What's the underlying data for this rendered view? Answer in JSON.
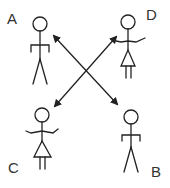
{
  "diagram": {
    "type": "stick-figure interaction diagram",
    "figures": [
      {
        "id": "A",
        "label": "A",
        "style": "male"
      },
      {
        "id": "B",
        "label": "B",
        "style": "male"
      },
      {
        "id": "C",
        "label": "C",
        "style": "female"
      },
      {
        "id": "D",
        "label": "D",
        "style": "female"
      }
    ],
    "arrows": [
      {
        "from": "A",
        "to": "B",
        "bidirectional": true
      },
      {
        "from": "D",
        "to": "C",
        "bidirectional": true
      }
    ],
    "colors": {
      "stroke": "#222222",
      "background": "#ffffff"
    }
  }
}
